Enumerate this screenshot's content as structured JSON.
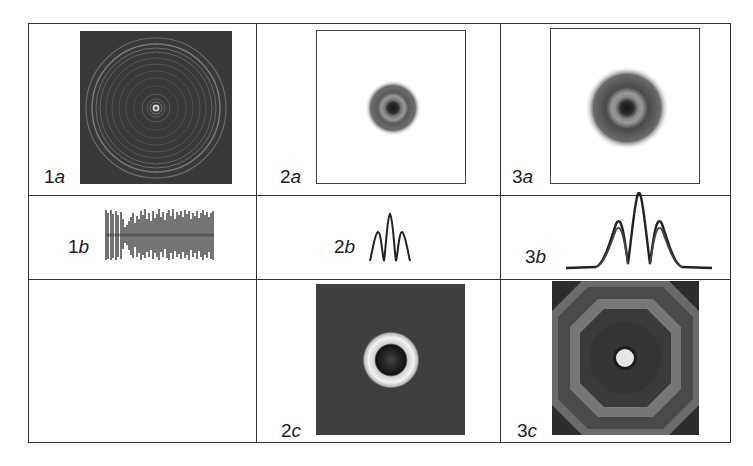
{
  "figure": {
    "columns": 3,
    "rows": 3,
    "cells": [
      {
        "id": "1a",
        "num": "1",
        "letter": "a",
        "type": "image",
        "description": "dark square with many concentric light rings, bright central spot"
      },
      {
        "id": "2a",
        "num": "2",
        "letter": "a",
        "type": "image",
        "description": "white frame with small gray ring spot at center"
      },
      {
        "id": "3a",
        "num": "3",
        "letter": "a",
        "type": "image",
        "description": "white frame with larger gray ring spot at center"
      },
      {
        "id": "1b",
        "num": "1",
        "letter": "b",
        "type": "profile",
        "description": "dense noisy oscillating profile"
      },
      {
        "id": "2b",
        "num": "2",
        "letter": "b",
        "type": "profile",
        "description": "small three-peak profile"
      },
      {
        "id": "3b",
        "num": "3",
        "letter": "b",
        "type": "profile",
        "description": "large three-peak profile with double-traced side lobes"
      },
      {
        "id": "1c",
        "num": "",
        "letter": "",
        "type": "empty",
        "description": "empty cell"
      },
      {
        "id": "2c",
        "num": "2",
        "letter": "c",
        "type": "image",
        "description": "dark gray square with white ring around dark disc"
      },
      {
        "id": "3c",
        "num": "3",
        "letter": "c",
        "type": "image",
        "description": "dark square with octagonal gray rings and bright central spot"
      }
    ]
  },
  "labels": {
    "l1a": {
      "num": "1",
      "letter": "a"
    },
    "l2a": {
      "num": "2",
      "letter": "a"
    },
    "l3a": {
      "num": "3",
      "letter": "a"
    },
    "l1b": {
      "num": "1",
      "letter": "b"
    },
    "l2b": {
      "num": "2",
      "letter": "b"
    },
    "l3b": {
      "num": "3",
      "letter": "b"
    },
    "l2c": {
      "num": "2",
      "letter": "c"
    },
    "l3c": {
      "num": "3",
      "letter": "c"
    }
  },
  "colors": {
    "line": "#333333",
    "dark_field": "#3a3a3a",
    "mid_gray": "#777777",
    "background": "#ffffff"
  }
}
